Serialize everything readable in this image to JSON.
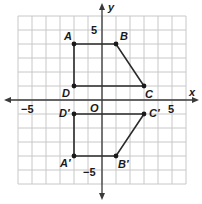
{
  "diagram": {
    "type": "coordinate-plane",
    "axes": {
      "x_label": "x",
      "y_label": "y",
      "origin_label": "O",
      "x_ticks": {
        "neg": "−5",
        "pos": "5"
      },
      "y_ticks": {
        "pos": "5",
        "neg": "−5"
      },
      "range": {
        "xmin": -6,
        "xmax": 6,
        "ymin": -6,
        "ymax": 6
      }
    },
    "figures": [
      {
        "name": "ABCD",
        "points": [
          {
            "label": "A",
            "x": -2,
            "y": 4
          },
          {
            "label": "B",
            "x": 1,
            "y": 4
          },
          {
            "label": "C",
            "x": 3,
            "y": 1
          },
          {
            "label": "D",
            "x": -2,
            "y": 1
          }
        ]
      },
      {
        "name": "A'B'C'D'",
        "points": [
          {
            "label": "A′",
            "x": -2,
            "y": -4
          },
          {
            "label": "B′",
            "x": 1,
            "y": -4
          },
          {
            "label": "C′",
            "x": 3,
            "y": -1
          },
          {
            "label": "D′",
            "x": -2,
            "y": -1
          }
        ]
      }
    ]
  }
}
